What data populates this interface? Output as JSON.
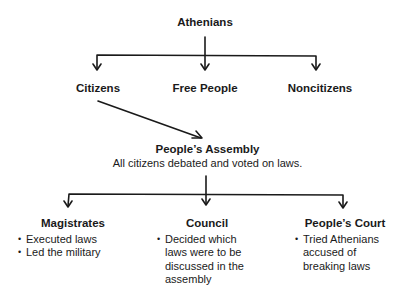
{
  "diagram": {
    "root": {
      "label": "Athenians"
    },
    "groups": [
      {
        "label": "Citizens"
      },
      {
        "label": "Free People"
      },
      {
        "label": "Noncitizens"
      }
    ],
    "assembly": {
      "label": "People’s Assembly",
      "description": "All citizens debated and voted on laws."
    },
    "branches": [
      {
        "label": "Magistrates",
        "bullets": [
          "Executed laws",
          "Led the military"
        ]
      },
      {
        "label": "Council",
        "bullets": [
          "Decided which laws were to be discussed in the assembly"
        ]
      },
      {
        "label": "People’s Court",
        "bullets": [
          "Tried Athenians accused of breaking laws"
        ]
      }
    ],
    "edges": [
      {
        "from": "Athenians",
        "to": "Citizens"
      },
      {
        "from": "Athenians",
        "to": "Free People"
      },
      {
        "from": "Athenians",
        "to": "Noncitizens"
      },
      {
        "from": "Citizens",
        "to": "People’s Assembly"
      },
      {
        "from": "People’s Assembly",
        "to": "Magistrates"
      },
      {
        "from": "People’s Assembly",
        "to": "Council"
      },
      {
        "from": "People’s Assembly",
        "to": "People’s Court"
      }
    ],
    "colors": {
      "line": "#1a1a1a",
      "text": "#1a1a1a",
      "background": "#ffffff"
    }
  }
}
